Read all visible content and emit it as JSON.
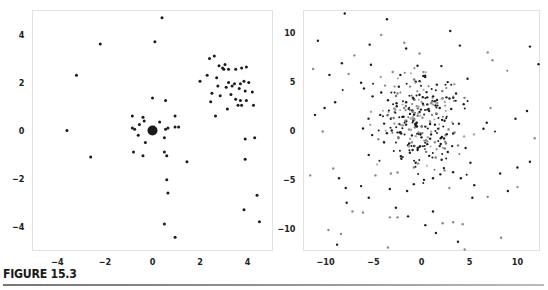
{
  "caption": "FIGURE 15.3",
  "chart_data": [
    {
      "type": "scatter",
      "title": "",
      "xlabel": "",
      "ylabel": "",
      "xlim": [
        -5.05,
        5.05
      ],
      "ylim": [
        -5.0,
        5.0
      ],
      "grid": false,
      "xticks": [
        -4,
        -2,
        0,
        2,
        4
      ],
      "xtick_labels": [
        "−4",
        "−2",
        "0",
        "2",
        "4"
      ],
      "yticks": [
        -4,
        -2,
        0,
        2,
        4
      ],
      "ytick_labels": [
        "−4",
        "−2",
        "0",
        "2",
        "4"
      ],
      "series": [
        {
          "name": "points",
          "color": "#1a1a1a",
          "points": [
            [
              0.4,
              4.7
            ],
            [
              -2.2,
              3.6
            ],
            [
              -3.2,
              2.3
            ],
            [
              0.1,
              3.7
            ],
            [
              -3.6,
              0.0
            ],
            [
              -2.6,
              -1.1
            ],
            [
              0.0,
              1.35
            ],
            [
              0.55,
              1.25
            ],
            [
              -0.85,
              0.6
            ],
            [
              -0.4,
              0.55
            ],
            [
              0.95,
              0.6
            ],
            [
              -0.85,
              0.1
            ],
            [
              -0.75,
              0.05
            ],
            [
              -0.55,
              0.25
            ],
            [
              -0.35,
              0.4
            ],
            [
              0.3,
              0.35
            ],
            [
              0.55,
              0.05
            ],
            [
              0.65,
              0.1
            ],
            [
              0.95,
              0.15
            ],
            [
              1.1,
              0.15
            ],
            [
              -0.6,
              -0.2
            ],
            [
              0.5,
              -0.3
            ],
            [
              -0.3,
              -0.5
            ],
            [
              -0.8,
              -0.9
            ],
            [
              -0.4,
              -1.05
            ],
            [
              0.5,
              -0.9
            ],
            [
              0.6,
              -1.05
            ],
            [
              1.45,
              -1.3
            ],
            [
              0.6,
              -2.05
            ],
            [
              0.65,
              -2.6
            ],
            [
              0.5,
              -3.9
            ],
            [
              0.95,
              -4.45
            ],
            [
              3.9,
              -1.2
            ],
            [
              4.4,
              -2.7
            ],
            [
              3.85,
              -3.3
            ],
            [
              4.5,
              -3.8
            ],
            [
              3.9,
              -0.35
            ],
            [
              4.3,
              -0.3
            ],
            [
              2.4,
              3.0
            ],
            [
              2.6,
              3.1
            ],
            [
              2.8,
              2.7
            ],
            [
              2.95,
              2.6
            ],
            [
              3.05,
              2.75
            ],
            [
              3.2,
              2.55
            ],
            [
              3.5,
              2.55
            ],
            [
              3.75,
              2.6
            ],
            [
              3.95,
              2.65
            ],
            [
              3.0,
              2.55
            ],
            [
              2.3,
              2.3
            ],
            [
              2.7,
              2.2
            ],
            [
              2.0,
              2.05
            ],
            [
              3.2,
              2.0
            ],
            [
              3.45,
              1.95
            ],
            [
              3.85,
              2.05
            ],
            [
              4.05,
              2.0
            ],
            [
              3.7,
              1.95
            ],
            [
              2.75,
              1.85
            ],
            [
              3.1,
              1.8
            ],
            [
              3.35,
              1.85
            ],
            [
              3.65,
              1.75
            ],
            [
              3.9,
              1.65
            ],
            [
              4.2,
              1.6
            ],
            [
              2.5,
              1.55
            ],
            [
              2.85,
              1.45
            ],
            [
              3.3,
              1.5
            ],
            [
              3.5,
              1.3
            ],
            [
              3.7,
              1.25
            ],
            [
              3.95,
              1.25
            ],
            [
              2.45,
              1.2
            ],
            [
              3.6,
              1.05
            ],
            [
              3.75,
              1.05
            ],
            [
              4.25,
              1.05
            ],
            [
              3.15,
              0.9
            ],
            [
              2.65,
              0.6
            ]
          ],
          "clusters": [
            {
              "center": [
                0.0,
                0.0
              ],
              "label": "large-dot"
            }
          ]
        }
      ]
    },
    {
      "type": "scatter",
      "title": "",
      "xlabel": "",
      "ylabel": "",
      "xlim": [
        -12.3,
        12.3
      ],
      "ylim": [
        -12.3,
        12.3
      ],
      "grid": false,
      "xticks": [
        -10,
        -5,
        0,
        5,
        10
      ],
      "xtick_labels": [
        "−10",
        "−5",
        "0",
        "5",
        "10"
      ],
      "yticks": [
        -10,
        -5,
        0,
        5,
        10
      ],
      "ytick_labels": [
        "−10",
        "−5",
        "0",
        "5",
        "10"
      ],
      "series": [
        {
          "name": "dark-points",
          "color": "#1e1e1e",
          "points": [
            [
              -8.0,
              12.0
            ],
            [
              -3.6,
              11.4
            ],
            [
              3.0,
              10.2
            ],
            [
              -10.8,
              9.2
            ],
            [
              -5.4,
              8.8
            ],
            [
              -1.6,
              8.4
            ],
            [
              4.0,
              8.7
            ],
            [
              11.3,
              8.6
            ],
            [
              12.2,
              6.8
            ],
            [
              -8.3,
              6.9
            ],
            [
              -9.6,
              5.7
            ],
            [
              -6.3,
              4.9
            ],
            [
              -2.2,
              5.7
            ],
            [
              -0.6,
              5.0
            ],
            [
              1.6,
              4.7
            ],
            [
              4.8,
              5.3
            ],
            [
              -11.1,
              1.6
            ],
            [
              -9.0,
              2.9
            ],
            [
              -10.1,
              2.3
            ],
            [
              -6.0,
              4.3
            ],
            [
              -4.2,
              3.9
            ],
            [
              -5.1,
              3.5
            ],
            [
              -3.5,
              3.1
            ],
            [
              -2.6,
              2.8
            ],
            [
              -1.6,
              2.9
            ],
            [
              -0.8,
              3.2
            ],
            [
              0.6,
              3.4
            ],
            [
              1.4,
              3.0
            ],
            [
              2.6,
              3.4
            ],
            [
              3.6,
              3.8
            ],
            [
              -4.3,
              1.6
            ],
            [
              -3.2,
              1.2
            ],
            [
              -2.0,
              1.4
            ],
            [
              -1.2,
              1.7
            ],
            [
              -0.2,
              1.9
            ],
            [
              0.8,
              2.0
            ],
            [
              1.9,
              2.3
            ],
            [
              3.1,
              2.2
            ],
            [
              4.4,
              2.7
            ],
            [
              -1.6,
              0.6
            ],
            [
              -0.5,
              0.8
            ],
            [
              0.4,
              0.4
            ],
            [
              1.4,
              0.6
            ],
            [
              2.4,
              1.0
            ],
            [
              3.9,
              0.7
            ],
            [
              -6.1,
              0.2
            ],
            [
              -3.1,
              0.0
            ],
            [
              -2.3,
              -0.2
            ],
            [
              -1.0,
              -0.5
            ],
            [
              0.0,
              -0.7
            ],
            [
              1.0,
              -0.4
            ],
            [
              2.0,
              -0.8
            ],
            [
              3.3,
              -0.3
            ],
            [
              6.8,
              0.8
            ],
            [
              9.8,
              1.2
            ],
            [
              11.0,
              2.0
            ],
            [
              -0.4,
              -1.8
            ],
            [
              -1.4,
              -1.5
            ],
            [
              0.6,
              -1.4
            ],
            [
              1.9,
              -1.6
            ],
            [
              3.2,
              -1.6
            ],
            [
              4.6,
              -1.8
            ],
            [
              -5.5,
              -2.5
            ],
            [
              -2.1,
              -2.9
            ],
            [
              -0.6,
              -3.3
            ],
            [
              0.8,
              -2.6
            ],
            [
              2.1,
              -3.0
            ],
            [
              5.1,
              -3.3
            ],
            [
              -8.6,
              -4.9
            ],
            [
              -7.9,
              -5.9
            ],
            [
              -6.3,
              -5.7
            ],
            [
              -3.3,
              -6.0
            ],
            [
              -1.5,
              -6.2
            ],
            [
              -0.8,
              -5.5
            ],
            [
              1.2,
              -4.9
            ],
            [
              4.1,
              -4.9
            ],
            [
              5.5,
              -5.6
            ],
            [
              8.2,
              -4.4
            ],
            [
              10.0,
              -3.8
            ],
            [
              11.3,
              -3.2
            ],
            [
              5.3,
              -6.9
            ],
            [
              -7.8,
              -7.4
            ],
            [
              -1.4,
              -8.8
            ],
            [
              1.2,
              -8.3
            ],
            [
              0.4,
              -9.7
            ],
            [
              1.5,
              -10.5
            ],
            [
              -8.8,
              -11.7
            ],
            [
              3.8,
              -11.4
            ],
            [
              -5.5,
              -6.9
            ],
            [
              9.0,
              -6.2
            ]
          ]
        },
        {
          "name": "gray-points",
          "color": "#8a8a8a",
          "points": [
            [
              -11.3,
              6.3
            ],
            [
              -4.2,
              9.8
            ],
            [
              -7.0,
              7.7
            ],
            [
              -1.8,
              9.0
            ],
            [
              -0.2,
              7.9
            ],
            [
              6.9,
              8.0
            ],
            [
              7.4,
              7.2
            ],
            [
              -7.6,
              5.8
            ],
            [
              -3.0,
              6.0
            ],
            [
              0.2,
              6.0
            ],
            [
              -1.2,
              4.5
            ],
            [
              -3.8,
              4.6
            ],
            [
              -2.5,
              3.8
            ],
            [
              -1.8,
              2.3
            ],
            [
              -1.2,
              2.1
            ],
            [
              -0.5,
              2.5
            ],
            [
              0.2,
              2.6
            ],
            [
              1.0,
              2.8
            ],
            [
              -2.8,
              1.9
            ],
            [
              -1.7,
              1.0
            ],
            [
              -0.9,
              1.2
            ],
            [
              0.1,
              1.3
            ],
            [
              1.1,
              1.6
            ],
            [
              -2.2,
              0.6
            ],
            [
              -1.3,
              0.1
            ],
            [
              -0.7,
              0.3
            ],
            [
              0.9,
              0.9
            ],
            [
              1.8,
              0.2
            ],
            [
              -2.4,
              -0.8
            ],
            [
              -0.3,
              -0.2
            ],
            [
              0.5,
              -1.0
            ],
            [
              1.4,
              -1.2
            ],
            [
              -1.0,
              -1.2
            ],
            [
              2.5,
              -0.5
            ],
            [
              -4.5,
              -0.9
            ],
            [
              7.2,
              2.3
            ],
            [
              11.8,
              -0.8
            ],
            [
              -10.3,
              -0.1
            ],
            [
              -9.2,
              -3.9
            ],
            [
              -4.8,
              -4.6
            ],
            [
              -3.2,
              -4.4
            ],
            [
              -2.5,
              -4.3
            ],
            [
              -0.8,
              -3.8
            ],
            [
              2.4,
              -4.1
            ],
            [
              2.9,
              -5.9
            ],
            [
              6.9,
              -6.8
            ],
            [
              10.0,
              -5.8
            ],
            [
              -7.2,
              -8.3
            ],
            [
              -6.1,
              -8.4
            ],
            [
              -3.3,
              -8.9
            ],
            [
              -2.5,
              -8.9
            ],
            [
              3.3,
              -9.4
            ],
            [
              4.3,
              -9.6
            ],
            [
              -9.7,
              -10.2
            ],
            [
              -8.4,
              -10.6
            ],
            [
              -3.5,
              -12.0
            ],
            [
              4.5,
              -12.2
            ],
            [
              8.3,
              -11.0
            ],
            [
              2.2,
              -9.5
            ],
            [
              -11.6,
              -4.6
            ]
          ]
        },
        {
          "name": "center-cluster",
          "color": "#555555",
          "distribution": "dense normal cluster centred near (0, 1), sd about 2.5",
          "count_estimate": 250
        }
      ]
    }
  ]
}
